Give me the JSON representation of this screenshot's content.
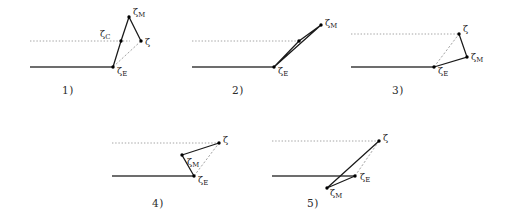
{
  "figure": {
    "colors": {
      "stroke_solid": "#1a1a1a",
      "stroke_baseline": "#3c3c3c",
      "stroke_dashed": "#9a9a9a",
      "stroke_dotted": "#9a9a9a",
      "marker": "#000000",
      "label": "#1f1f1f",
      "background": "#ffffff"
    },
    "symbols": {
      "zeta": "ζ",
      "sub_C": "C",
      "sub_E": "E",
      "sub_M": "M"
    },
    "panels": [
      {
        "id": "panel-1",
        "caption": "1)",
        "caption_x": 62,
        "caption_y": 84,
        "origin_x": 0,
        "origin_y": 0,
        "baseline": {
          "x1": 30,
          "y1": 67,
          "x2": 113,
          "y2": 67
        },
        "dotted": {
          "x1": 30,
          "y1": 41,
          "x2": 130,
          "y2": 41
        },
        "points": [
          {
            "name": "zeta-E",
            "x": 113,
            "y": 67,
            "label": "ζ",
            "sub": "E",
            "lx": 117,
            "ly": 74
          },
          {
            "name": "zeta-C",
            "x": 121,
            "y": 41,
            "label": "ζ",
            "sub": "C",
            "lx": 100,
            "ly": 37
          },
          {
            "name": "zeta-M",
            "x": 129,
            "y": 17,
            "label": "ζ",
            "sub": "M",
            "lx": 133,
            "ly": 15
          },
          {
            "name": "zeta",
            "x": 141,
            "y": 41,
            "label": "ζ",
            "sub": "",
            "lx": 145,
            "ly": 45
          }
        ],
        "solid_path": "M113,67 L121,41 L129,17 L141,41",
        "dashed_path": "M113,67 L141,41"
      },
      {
        "id": "panel-2",
        "caption": "2)",
        "caption_x": 232,
        "caption_y": 84,
        "origin_x": 0,
        "origin_y": 0,
        "baseline": {
          "x1": 192,
          "y1": 67,
          "x2": 274,
          "y2": 67
        },
        "dotted": {
          "x1": 192,
          "y1": 41,
          "x2": 299,
          "y2": 41
        },
        "points": [
          {
            "name": "zeta-E",
            "x": 274,
            "y": 67,
            "label": "ζ",
            "sub": "E",
            "lx": 278,
            "ly": 74
          },
          {
            "name": "zeta-C",
            "x": 299,
            "y": 41,
            "label": "",
            "sub": "",
            "lx": 0,
            "ly": 0
          },
          {
            "name": "zeta-M",
            "x": 321,
            "y": 25,
            "label": "ζ",
            "sub": "M",
            "lx": 325,
            "ly": 26
          }
        ],
        "solid_path": "M274,67 L299,41 L321,25 L274,67",
        "dashed_path": "M274,67 L321,25"
      },
      {
        "id": "panel-3",
        "caption": "3)",
        "caption_x": 392,
        "caption_y": 84,
        "origin_x": 0,
        "origin_y": 0,
        "baseline": {
          "x1": 351,
          "y1": 67,
          "x2": 434,
          "y2": 67
        },
        "dotted": {
          "x1": 351,
          "y1": 34,
          "x2": 459,
          "y2": 34
        },
        "points": [
          {
            "name": "zeta-E",
            "x": 434,
            "y": 67,
            "label": "ζ",
            "sub": "E",
            "lx": 438,
            "ly": 74
          },
          {
            "name": "zeta",
            "x": 459,
            "y": 34,
            "label": "ζ",
            "sub": "",
            "lx": 463,
            "ly": 32
          },
          {
            "name": "zeta-M",
            "x": 467,
            "y": 57,
            "label": "ζ",
            "sub": "M",
            "lx": 471,
            "ly": 60
          }
        ],
        "solid_path": "M434,67 L467,57 L459,34",
        "dashed_path": "M434,67 L459,34"
      },
      {
        "id": "panel-4",
        "caption": "4)",
        "caption_x": 152,
        "caption_y": 197,
        "origin_x": 0,
        "origin_y": 0,
        "baseline": {
          "x1": 112,
          "y1": 176,
          "x2": 194,
          "y2": 176
        },
        "dotted": {
          "x1": 112,
          "y1": 143,
          "x2": 219,
          "y2": 143
        },
        "points": [
          {
            "name": "zeta-E",
            "x": 194,
            "y": 176,
            "label": "ζ",
            "sub": "E",
            "lx": 198,
            "ly": 183
          },
          {
            "name": "zeta-M",
            "x": 182,
            "y": 155,
            "label": "ζ",
            "sub": "M",
            "lx": 187,
            "ly": 165
          },
          {
            "name": "zeta",
            "x": 219,
            "y": 143,
            "label": "ζ",
            "sub": "",
            "lx": 223,
            "ly": 143
          }
        ],
        "solid_path": "M194,176 L182,155 L219,143",
        "dashed_path": "M194,176 L219,143"
      },
      {
        "id": "panel-5",
        "caption": "5)",
        "caption_x": 307,
        "caption_y": 197,
        "origin_x": 0,
        "origin_y": 0,
        "baseline": {
          "x1": 272,
          "y1": 176,
          "x2": 355,
          "y2": 176
        },
        "dotted": {
          "x1": 272,
          "y1": 141,
          "x2": 379,
          "y2": 141
        },
        "points": [
          {
            "name": "zeta-M",
            "x": 327,
            "y": 188,
            "label": "ζ",
            "sub": "M",
            "lx": 330,
            "ly": 196
          },
          {
            "name": "zeta-E",
            "x": 355,
            "y": 176,
            "label": "ζ",
            "sub": "E",
            "lx": 360,
            "ly": 180
          },
          {
            "name": "zeta",
            "x": 379,
            "y": 141,
            "label": "ζ",
            "sub": "",
            "lx": 383,
            "ly": 141
          }
        ],
        "solid_path": "M327,188 L355,176 L327,188 L379,141",
        "dashed_path": "M355,176 L379,141"
      }
    ]
  }
}
